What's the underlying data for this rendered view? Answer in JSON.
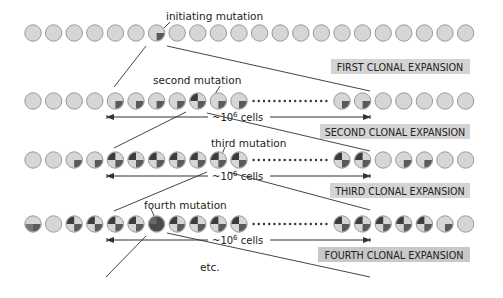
{
  "colors": {
    "cell_fill": "#d6d6d6",
    "cell_stroke": "#9a9a9a",
    "mut1": "#5a5a5a",
    "mut2": "#3c3c3c",
    "mut4": "#4a4a4a",
    "banner_bg": "#d4d4d4",
    "line": "#444444"
  },
  "labels": {
    "initiating": "initiating mutation",
    "second": "second mutation",
    "third": "third mutation",
    "fourth": "fourth mutation",
    "etc": "etc.",
    "cells1": "~10",
    "cells_exp": "6",
    "cells_word": " cells"
  },
  "expansions": [
    {
      "label": "FIRST CLONAL EXPANSION"
    },
    {
      "label": "SECOND CLONAL EXPANSION"
    },
    {
      "label": "THIRD CLONAL EXPANSION"
    },
    {
      "label": "FOURTH CLONAL EXPANSION"
    }
  ],
  "rows": [
    {
      "y": 33,
      "left": [
        0,
        0,
        0,
        0,
        0,
        0,
        1,
        0,
        0,
        0,
        0,
        0,
        0,
        0,
        0,
        0,
        0,
        0,
        0,
        0,
        0,
        0
      ],
      "dots": false,
      "right": []
    },
    {
      "y": 101,
      "left": [
        0,
        0,
        0,
        0,
        1,
        1,
        1,
        1,
        2,
        1,
        1
      ],
      "dots": true,
      "right": [
        1,
        1,
        0,
        0,
        0,
        0,
        0
      ]
    },
    {
      "y": 160,
      "left": [
        0,
        0,
        1,
        1,
        2,
        2,
        2,
        2,
        2,
        3,
        2
      ],
      "dots": true,
      "right": [
        2,
        2,
        0,
        1,
        1,
        0,
        0
      ]
    },
    {
      "y": 224,
      "left": [
        5,
        0,
        2,
        2,
        2,
        2,
        4,
        2,
        2,
        2,
        2
      ],
      "dots": true,
      "right": [
        2,
        2,
        2,
        2,
        2,
        1,
        0
      ]
    }
  ]
}
